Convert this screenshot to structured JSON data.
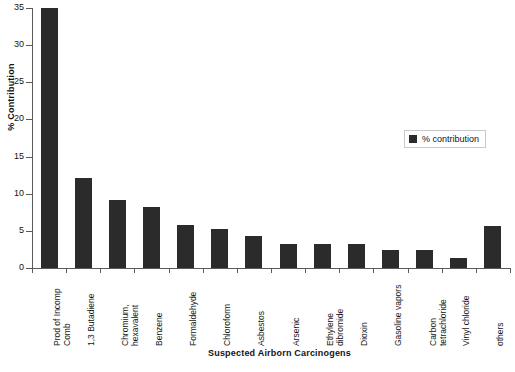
{
  "chart_data": {
    "type": "bar",
    "title": "",
    "xlabel": "Suspected Airborn Carcinogens",
    "ylabel": "% Contribution",
    "ylim": [
      0,
      35
    ],
    "yticks": [
      0,
      5,
      10,
      15,
      20,
      25,
      30,
      35
    ],
    "grid": false,
    "legend_position": "right",
    "series": [
      {
        "name": "% contribution",
        "color": "#2b2b2b",
        "values": [
          35,
          12.1,
          9.2,
          8.2,
          5.8,
          5.2,
          4.3,
          3.2,
          3.2,
          3.3,
          2.4,
          2.4,
          1.4,
          5.6
        ]
      }
    ],
    "categories": [
      "Prod of Incomp\nComb",
      "1,3 Butadiene",
      "Chromium,\nhexavalent",
      "Benzene",
      "Formaldehyde",
      "Chloroform",
      "Asbestos",
      "Arsenic",
      "Ethylene\ndibromide",
      "Dioxin",
      "Gasoline vapors",
      "Carbon\ntetrachloride",
      "Vinyl chloride",
      "others"
    ]
  },
  "legend": {
    "entries": [
      {
        "label": "% contribution",
        "color": "#2b2b2b"
      }
    ]
  },
  "axes": {
    "y_title": "% Contribution",
    "x_title": "Suspected Airborn Carcinogens"
  }
}
